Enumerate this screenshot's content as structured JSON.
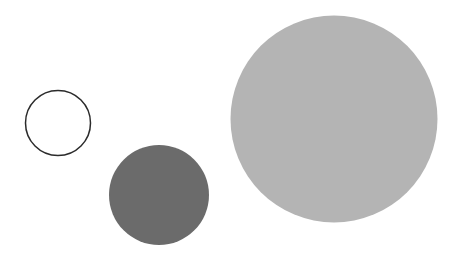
{
  "figure": {
    "title": "",
    "background_color": "#ffffff",
    "width": 454,
    "height": 260
  },
  "chart_data": {
    "type": "scatter",
    "title": "",
    "subtitle": "",
    "xlabel": "",
    "ylabel": "",
    "xlim": [
      0,
      454
    ],
    "ylim": [
      0,
      260
    ],
    "grid": false,
    "legend": null,
    "axes_visible": false,
    "tick_labels": {
      "x": [],
      "y": []
    },
    "annotations": [],
    "marker_shape": "circle",
    "series": [
      {
        "name": "outline-circle",
        "points": [
          {
            "label": "small-outline-circle",
            "cx": 58,
            "cy": 123,
            "diameter": 65,
            "radius": 32.5,
            "fill": "none",
            "stroke": "#2b2b2b",
            "stroke_width": 1.5,
            "opacity": 1
          }
        ]
      },
      {
        "name": "dark-gray-circle",
        "points": [
          {
            "label": "medium-dark-circle",
            "cx": 159,
            "cy": 195,
            "diameter": 100,
            "radius": 50,
            "fill": "#6b6b6b",
            "stroke": "none",
            "stroke_width": 0,
            "opacity": 1
          }
        ]
      },
      {
        "name": "light-gray-circle",
        "points": [
          {
            "label": "large-light-circle",
            "cx": 334,
            "cy": 119,
            "diameter": 207,
            "radius": 103.5,
            "fill": "#b4b4b4",
            "stroke": "none",
            "stroke_width": 0,
            "opacity": 1
          }
        ]
      }
    ],
    "colors": {
      "background": "#ffffff",
      "outline_stroke": "#2b2b2b",
      "dark_fill": "#6b6b6b",
      "light_fill": "#b4b4b4"
    }
  }
}
